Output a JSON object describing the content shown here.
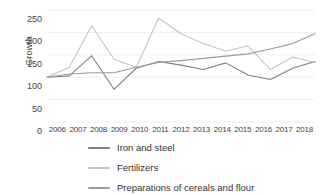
{
  "chart_data": {
    "type": "line",
    "title": "",
    "xlabel": "",
    "ylabel": "Growth",
    "grid": true,
    "legend_position": "bottom",
    "ylim": [
      0,
      250
    ],
    "yticks": [
      0,
      50,
      100,
      150,
      200,
      250
    ],
    "categories": [
      "2006",
      "2007",
      "2008",
      "2009",
      "2010",
      "2011",
      "2012",
      "2013",
      "2014",
      "2015",
      "2016",
      "2017",
      "2018"
    ],
    "x": [
      2006,
      2007,
      2008,
      2009,
      2010,
      2011,
      2012,
      2013,
      2014,
      2015,
      2016,
      2017,
      2018
    ],
    "series": [
      {
        "name": "Iron and steel",
        "color": "#808080",
        "values": [
          100,
          103,
          148,
          73,
          120,
          135,
          127,
          117,
          132,
          105,
          95,
          120,
          135
        ]
      },
      {
        "name": "Fertilizers",
        "color": "#c4c4c4",
        "values": [
          100,
          122,
          215,
          140,
          122,
          232,
          197,
          175,
          158,
          170,
          117,
          145,
          133
        ]
      },
      {
        "name": "Preparations of cereals and flour",
        "color": "#9b9b9b",
        "values": [
          100,
          107,
          110,
          110,
          122,
          133,
          137,
          142,
          147,
          152,
          163,
          175,
          197
        ]
      }
    ]
  },
  "axis": {
    "y_label": "Growth",
    "y_tick_labels": [
      "250",
      "200",
      "150",
      "100",
      "50",
      "0"
    ],
    "x_tick_labels": [
      "2006",
      "2007",
      "2008",
      "2009",
      "2010",
      "2011",
      "2012",
      "2013",
      "2014",
      "2015",
      "2016",
      "2017",
      "2018"
    ]
  },
  "legend": {
    "items": [
      {
        "label": "Iron and steel",
        "color": "#808080"
      },
      {
        "label": "Fertilizers",
        "color": "#c4c4c4"
      },
      {
        "label": "Preparations of cereals and flour",
        "color": "#9b9b9b"
      }
    ]
  },
  "colors": {
    "background": "#ffffff",
    "gridline": "#e2e2e2",
    "text": "#3f3f3f"
  }
}
